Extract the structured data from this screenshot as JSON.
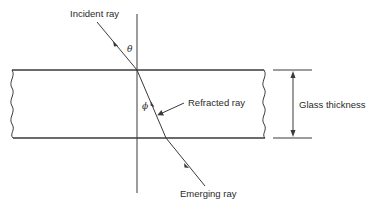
{
  "diagram": {
    "labels": {
      "incident_ray": "Incident ray",
      "refracted_ray": "Refracted ray",
      "emerging_ray": "Emerging ray",
      "glass_thickness": "Glass thickness",
      "angle_incidence": "θ",
      "angle_refraction": "ϕ"
    },
    "colors": {
      "line": "#3a3a3a",
      "text": "#2a2a2a",
      "background": "#ffffff"
    }
  }
}
